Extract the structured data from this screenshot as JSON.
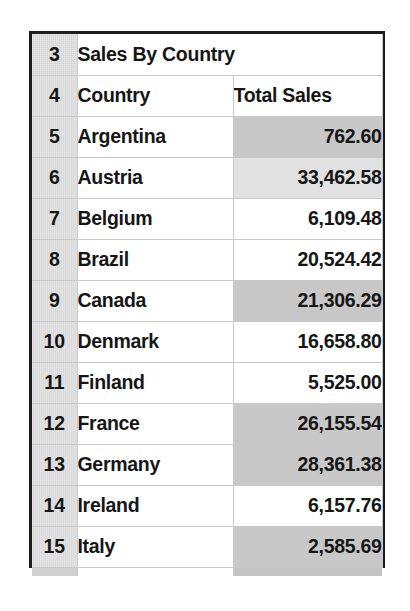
{
  "sheet": {
    "title_row_number": "3",
    "title": "Sales By Country",
    "header_row_number": "4",
    "columns": [
      "Country",
      "Total Sales"
    ],
    "accent_shade_dark": "#bdbdbd",
    "accent_shade_light": "#d9d9d9",
    "gutter_color": "#d3d3d3",
    "border_color": "#1d1d1d",
    "rows": [
      {
        "row_number": "5",
        "country": "Argentina",
        "total_sales": "762.60",
        "shade": "dark"
      },
      {
        "row_number": "6",
        "country": "Austria",
        "total_sales": "33,462.58",
        "shade": "light"
      },
      {
        "row_number": "7",
        "country": "Belgium",
        "total_sales": "6,109.48",
        "shade": "none"
      },
      {
        "row_number": "8",
        "country": "Brazil",
        "total_sales": "20,524.42",
        "shade": "none"
      },
      {
        "row_number": "9",
        "country": "Canada",
        "total_sales": "21,306.29",
        "shade": "dark"
      },
      {
        "row_number": "10",
        "country": "Denmark",
        "total_sales": "16,658.80",
        "shade": "none"
      },
      {
        "row_number": "11",
        "country": "Finland",
        "total_sales": "5,525.00",
        "shade": "none"
      },
      {
        "row_number": "12",
        "country": "France",
        "total_sales": "26,155.54",
        "shade": "dark"
      },
      {
        "row_number": "13",
        "country": "Germany",
        "total_sales": "28,361.38",
        "shade": "dark"
      },
      {
        "row_number": "14",
        "country": "Ireland",
        "total_sales": "6,157.76",
        "shade": "none"
      },
      {
        "row_number": "15",
        "country": "Italy",
        "total_sales": "2,585.69",
        "shade": "dark"
      }
    ]
  },
  "chart_data": {
    "type": "table",
    "title": "Sales By Country",
    "columns": [
      "Country",
      "Total Sales"
    ],
    "categories": [
      "Argentina",
      "Austria",
      "Belgium",
      "Brazil",
      "Canada",
      "Denmark",
      "Finland",
      "France",
      "Germany",
      "Ireland",
      "Italy"
    ],
    "values": [
      762.6,
      33462.58,
      6109.48,
      20524.42,
      21306.29,
      16658.8,
      5525.0,
      26155.54,
      28361.38,
      6157.76,
      2585.69
    ],
    "value_labels": [
      "762.60",
      "33,462.58",
      "6,109.48",
      "20,524.42",
      "21,306.29",
      "16,658.80",
      "5,525.00",
      "26,155.54",
      "28,361.38",
      "6,157.76",
      "2,585.69"
    ],
    "row_numbers": [
      "5",
      "6",
      "7",
      "8",
      "9",
      "10",
      "11",
      "12",
      "13",
      "14",
      "15"
    ],
    "xlabel": "Country",
    "ylabel": "Total Sales",
    "grid": true,
    "legend": "none"
  }
}
